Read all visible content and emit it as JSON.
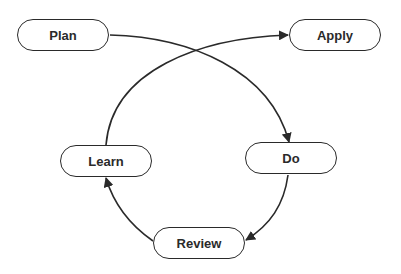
{
  "diagram": {
    "type": "cycle-flow",
    "nodes": [
      {
        "id": "plan",
        "label": "Plan"
      },
      {
        "id": "apply",
        "label": "Apply"
      },
      {
        "id": "learn",
        "label": "Learn"
      },
      {
        "id": "do",
        "label": "Do"
      },
      {
        "id": "review",
        "label": "Review"
      }
    ],
    "edges": [
      {
        "from": "plan",
        "to": "do"
      },
      {
        "from": "do",
        "to": "review"
      },
      {
        "from": "review",
        "to": "learn"
      },
      {
        "from": "learn",
        "to": "apply"
      }
    ],
    "colors": {
      "stroke": "#2a2a2a",
      "background": "#ffffff"
    }
  }
}
